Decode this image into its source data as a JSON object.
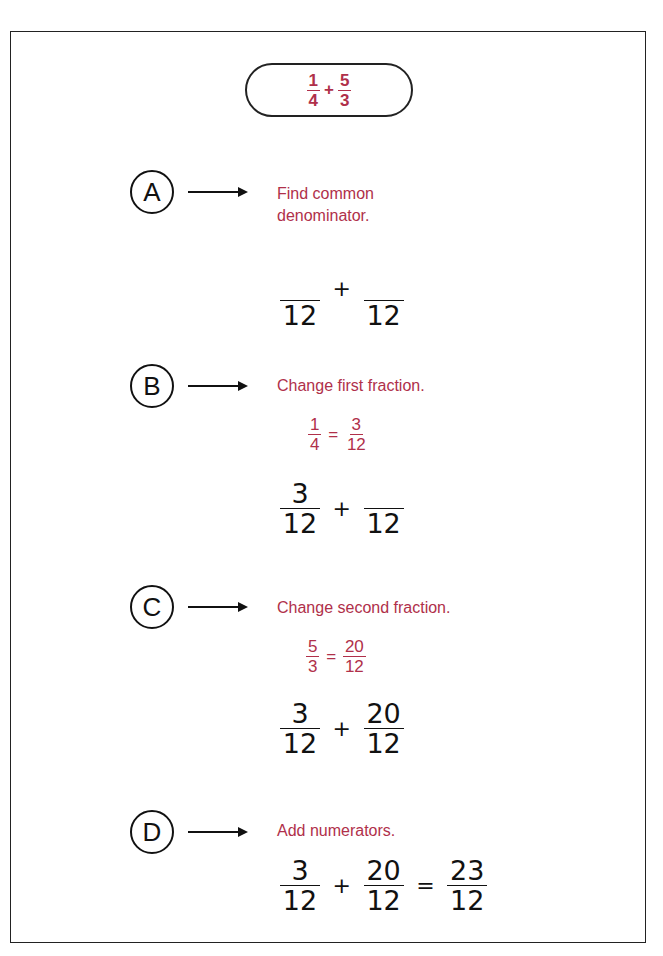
{
  "problem": {
    "expression": [
      {
        "type": "fraction",
        "numerator": "1",
        "denominator": "4"
      },
      {
        "type": "operator",
        "value": "+"
      },
      {
        "type": "fraction",
        "numerator": "5",
        "denominator": "3"
      }
    ],
    "f1_num": "1",
    "f1_den": "4",
    "op": "+",
    "f2_num": "5",
    "f2_den": "3"
  },
  "steps": [
    {
      "marker": "A",
      "instruction_line1": "Find common",
      "instruction_line2": "denominator.",
      "work": {
        "f1_num": "",
        "f1_den": "12",
        "op": "+",
        "f2_num": "",
        "f2_den": "12"
      }
    },
    {
      "marker": "B",
      "instruction": "Change first fraction.",
      "conversion": {
        "from_num": "1",
        "from_den": "4",
        "eq": "=",
        "to_num": "3",
        "to_den": "12"
      },
      "work": {
        "f1_num": "3",
        "f1_den": "12",
        "op": "+",
        "f2_num": "",
        "f2_den": "12"
      }
    },
    {
      "marker": "C",
      "instruction": "Change second fraction.",
      "conversion": {
        "from_num": "5",
        "from_den": "3",
        "eq": "=",
        "to_num": "20",
        "to_den": "12"
      },
      "work": {
        "f1_num": "3",
        "f1_den": "12",
        "op": "+",
        "f2_num": "20",
        "f2_den": "12"
      }
    },
    {
      "marker": "D",
      "instruction": "Add numerators.",
      "work": {
        "f1_num": "3",
        "f1_den": "12",
        "op": "+",
        "f2_num": "20",
        "f2_den": "12",
        "eq": "=",
        "r_num": "23",
        "r_den": "12"
      }
    }
  ],
  "colors": {
    "accent": "#b0304a",
    "ink": "#111111",
    "border": "#222222"
  }
}
